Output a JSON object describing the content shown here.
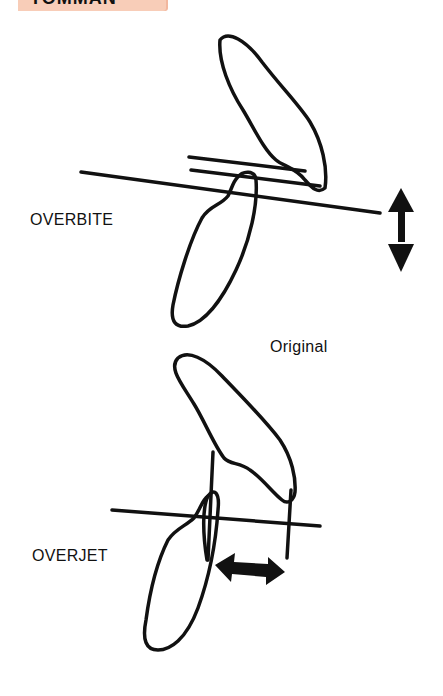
{
  "header": {
    "clipped_label": "TOMMAN",
    "band_color": "#f8cdb8"
  },
  "labels": {
    "overbite": "OVERBITE",
    "original": "Original",
    "overjet": "OVERJET"
  },
  "colors": {
    "ink": "#111111",
    "background": "#ffffff"
  }
}
